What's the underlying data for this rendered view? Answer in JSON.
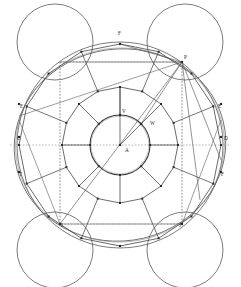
{
  "figure": {
    "kind": "geometric-construction-diagram",
    "width": 241,
    "height": 287,
    "background": "#ffffff",
    "stroke_dark": "#3a3a3a",
    "stroke_mid": "#5a5a5a",
    "stroke_light": "#8f8f8f",
    "stroke_dotted": "#9a9a9a",
    "vertex_fill": "#2b2b2b"
  },
  "labels": {
    "center": "A",
    "inner_top": "V",
    "inner_upper_right": "W",
    "top_apex": "F",
    "top_right_corner": "P",
    "right_upper": "E",
    "right_middle": "D",
    "right_lower": "F",
    "left_upper": "E",
    "left_middle": "C",
    "left_lower": "T",
    "bottom_left_corner": "I",
    "bottom_right_corner": "J"
  },
  "label_positions": {
    "center": [
      125,
      148
    ],
    "inner_top": [
      122,
      109
    ],
    "inner_upper_right": [
      150,
      121
    ],
    "top_apex": [
      118,
      31
    ],
    "top_right_corner": [
      184,
      55
    ],
    "right_upper": [
      218,
      104
    ],
    "right_middle": [
      224,
      136
    ],
    "right_lower": [
      221,
      172
    ],
    "left_upper": [
      20,
      104
    ],
    "left_middle": [
      17,
      136
    ],
    "left_lower": [
      19,
      172
    ],
    "bottom_left_corner": [
      61,
      223
    ],
    "bottom_right_corner": [
      179,
      223
    ]
  },
  "geometry": {
    "center": [
      120,
      145
    ],
    "inner_circle_radius": 30,
    "mid_ring_radius": 58,
    "outer_ring_radius": 101,
    "outer_circle_radius": 103,
    "ellipse_rx": 106,
    "ellipse_ry": 96,
    "ellipse_rotation_deg": -8,
    "corner_circle_radius": 38,
    "corner_circle_centers": [
      [
        55,
        42
      ],
      [
        185,
        42
      ],
      [
        55,
        250
      ],
      [
        185,
        250
      ]
    ],
    "dotted_rect": {
      "x0": 60,
      "y0": 62,
      "x1": 182,
      "y1": 224
    },
    "key_points": {
      "A": [
        120,
        145
      ],
      "V": [
        120,
        115
      ],
      "W": [
        141,
        124
      ],
      "F_top": [
        120,
        44
      ],
      "P": [
        182,
        62
      ],
      "I": [
        60,
        224
      ],
      "J": [
        182,
        224
      ],
      "bottom_apex": [
        120,
        246
      ],
      "left_mid": [
        19,
        145
      ],
      "right_mid": [
        221,
        145
      ]
    }
  }
}
